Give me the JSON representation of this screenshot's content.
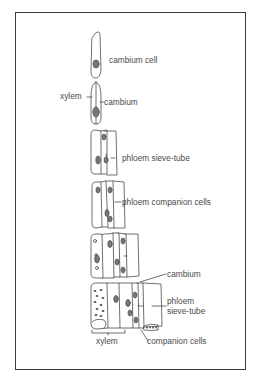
{
  "figure": {
    "type": "biological-diagram",
    "stages": [
      {
        "id": 1,
        "labels": [
          "cambium cell"
        ]
      },
      {
        "id": 2,
        "labels": [
          "xylem",
          "cambium"
        ]
      },
      {
        "id": 3,
        "labels": [
          "phloem sieve-tube"
        ]
      },
      {
        "id": 4,
        "labels": [
          "phloem companion cells"
        ]
      },
      {
        "id": 5,
        "labels": []
      },
      {
        "id": 6,
        "labels": [
          "cambium",
          "phloem sieve-tube",
          "xylem",
          "companion cells"
        ]
      }
    ]
  },
  "labels": {
    "cambium_cell": "cambium cell",
    "xylem_top": "xylem",
    "cambium_top": "cambium",
    "phloem_sieve_tube_mid": "phloem sieve-tube",
    "phloem_companion_cells": "phloem companion cells",
    "cambium_bottom": "cambium",
    "phloem_bottom_line1": "phloem",
    "phloem_bottom_line2": "sieve-tube",
    "xylem_bottom": "xylem",
    "companion_cells_bottom": "companion cells"
  },
  "colors": {
    "line": "#4a4a4a",
    "nucleus": "#777777",
    "frame": "#3a3a3a",
    "background": "#ffffff"
  }
}
